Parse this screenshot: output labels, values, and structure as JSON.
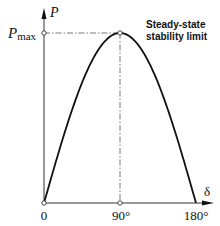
{
  "chart_data": {
    "type": "line",
    "title": "",
    "xlabel": "δ",
    "ylabel": "P",
    "x_ticks": [
      "0",
      "90°",
      "180°"
    ],
    "y_ticks": [
      "P_max"
    ],
    "xlim": [
      0,
      180
    ],
    "ylim": [
      0,
      1
    ],
    "grid": false,
    "legend": null,
    "series": [
      {
        "name": "P = Pmax sin δ",
        "x": [
          0,
          15,
          30,
          45,
          60,
          75,
          90,
          105,
          120,
          135,
          150,
          165,
          180
        ],
        "y": [
          0,
          0.259,
          0.5,
          0.707,
          0.866,
          0.966,
          1.0,
          0.966,
          0.866,
          0.707,
          0.5,
          0.259,
          0
        ]
      }
    ],
    "annotations": [
      {
        "text": "Steady-state stability limit",
        "x": 90,
        "y": 1.0
      }
    ],
    "reference_lines": [
      {
        "type": "horizontal",
        "y": 1.0,
        "style": "dash-dot",
        "label": "Pmax"
      },
      {
        "type": "vertical",
        "x": 90,
        "style": "dash-dot"
      }
    ]
  },
  "labels": {
    "y_axis": "P",
    "y_max_main": "P",
    "y_max_sub": "max",
    "x_axis": "δ",
    "tick_0": "0",
    "tick_90": "90°",
    "tick_180": "180°",
    "annotation_line1": "Steady-state",
    "annotation_line2": "stability limit"
  }
}
